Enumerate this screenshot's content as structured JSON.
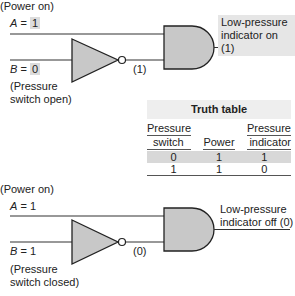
{
  "top_circuit": {
    "power_label": "(Power on)",
    "a_label": "A",
    "a_eq": " = ",
    "a_value": "1",
    "b_label": "B",
    "b_eq": " = ",
    "b_value": "0",
    "switch_label_line1": "(Pressure",
    "switch_label_line2": "switch open)",
    "inverter_output": "(1)",
    "output_label_line1": "Low-pressure",
    "output_label_line2": "indicator on (1)"
  },
  "truth_table": {
    "title": "Truth table",
    "headers": [
      {
        "line1": "Pressure",
        "line2": "switch"
      },
      {
        "line1": "",
        "line2": "Power"
      },
      {
        "line1": "Pressure",
        "line2": "indicator"
      }
    ],
    "rows": [
      [
        "0",
        "1",
        "1"
      ],
      [
        "1",
        "1",
        "0"
      ]
    ]
  },
  "bottom_circuit": {
    "power_label": "(Power on)",
    "a_label": "A",
    "a_eq": " = ",
    "a_value": "1",
    "b_label": "B",
    "b_eq": " = ",
    "b_value": "1",
    "switch_label_line1": "(Pressure",
    "switch_label_line2": "switch closed)",
    "inverter_output": "(0)",
    "output_label_line1": "Low-pressure",
    "output_label_line2": "indicator off (0)"
  },
  "colors": {
    "gate_fill": "#c8c8c8",
    "stroke": "#222222",
    "label_highlight": "#dcdcdc"
  }
}
